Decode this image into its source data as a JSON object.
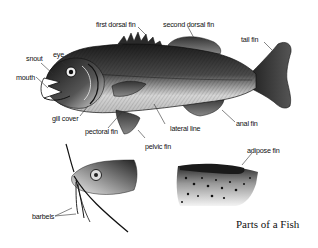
{
  "title": "Parts of a Fish",
  "labels": {
    "first_dorsal_fin": "first dorsal fin",
    "second_dorsal_fin": "second dorsal fin",
    "tail_fin": "tail fin",
    "snout": "snout",
    "eye": "eye",
    "mouth": "mouth",
    "gill_cover": "gill cover",
    "pectoral_fin": "pectoral fin",
    "lateral_line": "lateral line",
    "anal_fin": "anal fin",
    "pelvic_fin": "pelvic fin",
    "adipose_fin": "adipose fin",
    "barbels": "barbels"
  },
  "colors": {
    "ink": "#111111",
    "body_dark": "#2a2a2a",
    "body_mid": "#6a6a6a",
    "belly": "#d8d8d8",
    "background": "#ffffff"
  }
}
